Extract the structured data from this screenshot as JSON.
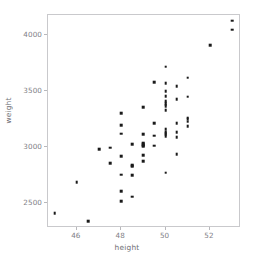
{
  "chart_data": {
    "type": "scatter",
    "title": "",
    "xlabel": "height",
    "ylabel": "weight",
    "xlim": [
      44.7,
      53.4
    ],
    "ylim": [
      2280,
      4180
    ],
    "xticks": [
      46,
      48,
      50,
      52
    ],
    "yticks": [
      2500,
      3000,
      3500,
      4000
    ],
    "xtick_labels": [
      "46",
      "48",
      "50",
      "52"
    ],
    "ytick_labels": [
      "2500",
      "3000",
      "3500",
      "4000"
    ],
    "grid": false,
    "legend": null,
    "marker": "square",
    "marker_color": "#1a1a1a",
    "marker_size": 2.6,
    "n_points": 81,
    "points": [
      [
        45.0,
        2410
      ],
      [
        46.0,
        2690
      ],
      [
        46.5,
        2340
      ],
      [
        47.0,
        2985
      ],
      [
        47.5,
        2995
      ],
      [
        47.5,
        2860
      ],
      [
        48.0,
        3305
      ],
      [
        48.0,
        3195
      ],
      [
        48.0,
        3120
      ],
      [
        48.0,
        2920
      ],
      [
        48.0,
        2755
      ],
      [
        48.0,
        2610
      ],
      [
        48.0,
        2520
      ],
      [
        48.5,
        3030
      ],
      [
        48.5,
        2840
      ],
      [
        48.5,
        2830
      ],
      [
        48.5,
        2750
      ],
      [
        48.5,
        2560
      ],
      [
        49.0,
        3355
      ],
      [
        49.0,
        3115
      ],
      [
        49.0,
        3040
      ],
      [
        49.0,
        3030
      ],
      [
        49.0,
        3020
      ],
      [
        49.0,
        3010
      ],
      [
        49.0,
        2930
      ],
      [
        49.0,
        2875
      ],
      [
        49.5,
        3580
      ],
      [
        49.5,
        3215
      ],
      [
        49.5,
        3105
      ],
      [
        49.5,
        3015
      ],
      [
        50.0,
        3720
      ],
      [
        50.0,
        3570
      ],
      [
        50.0,
        3500
      ],
      [
        50.0,
        3455
      ],
      [
        50.0,
        3410
      ],
      [
        50.0,
        3395
      ],
      [
        50.0,
        3380
      ],
      [
        50.0,
        3365
      ],
      [
        50.0,
        3330
      ],
      [
        50.0,
        3160
      ],
      [
        50.0,
        3140
      ],
      [
        50.0,
        3125
      ],
      [
        50.0,
        3115
      ],
      [
        50.0,
        3100
      ],
      [
        50.0,
        2775
      ],
      [
        50.5,
        3545
      ],
      [
        50.5,
        3430
      ],
      [
        50.5,
        3215
      ],
      [
        50.5,
        3135
      ],
      [
        50.5,
        3090
      ],
      [
        50.5,
        2940
      ],
      [
        51.0,
        3620
      ],
      [
        51.0,
        3450
      ],
      [
        51.0,
        3265
      ],
      [
        51.0,
        3250
      ],
      [
        51.0,
        3230
      ],
      [
        51.0,
        3190
      ],
      [
        52.0,
        3910
      ],
      [
        53.0,
        4130
      ],
      [
        53.0,
        4050
      ]
    ]
  }
}
